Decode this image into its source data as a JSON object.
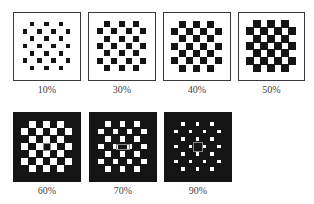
{
  "figure": {
    "panels": [
      {
        "label": "10%",
        "percent": 10,
        "x": 13,
        "y": 12,
        "w": 68,
        "h": 69,
        "theme": "light",
        "square_size": 4.5
      },
      {
        "label": "30%",
        "percent": 30,
        "x": 88,
        "y": 12,
        "w": 68,
        "h": 69,
        "theme": "light",
        "square_size": 6
      },
      {
        "label": "40%",
        "percent": 40,
        "x": 163,
        "y": 12,
        "w": 68,
        "h": 69,
        "theme": "light",
        "square_size": 7
      },
      {
        "label": "50%",
        "percent": 50,
        "x": 238,
        "y": 12,
        "w": 67,
        "h": 69,
        "theme": "light",
        "square_size": 8.2
      },
      {
        "label": "60%",
        "percent": 60,
        "x": 13,
        "y": 112,
        "w": 68,
        "h": 70,
        "theme": "dark",
        "square_size": 7,
        "center_marker": "outline-square"
      },
      {
        "label": "70%",
        "percent": 70,
        "x": 89,
        "y": 112,
        "w": 68,
        "h": 70,
        "theme": "dark",
        "square_size": 5.5,
        "center_marker": "outline-bar"
      },
      {
        "label": "90%",
        "percent": 90,
        "x": 164,
        "y": 112,
        "w": 68,
        "h": 70,
        "theme": "dark",
        "square_size": 3.5,
        "center_marker": "outline-cross"
      }
    ],
    "colors": {
      "dark": "#141414",
      "light": "#ffffff",
      "border": "#3a3a3a"
    }
  }
}
